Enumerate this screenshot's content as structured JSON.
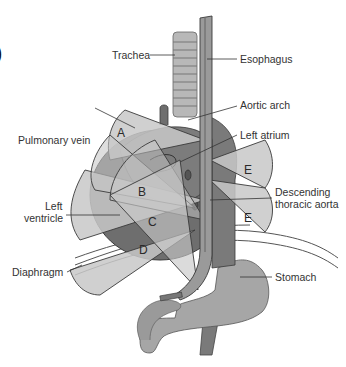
{
  "figure": {
    "partial_panel_mark": ")",
    "labels": {
      "trachea": "Trachea",
      "esophagus": "Esophagus",
      "aortic_arch": "Aortic arch",
      "pulmonary_vein": "Pulmonary vein",
      "left_atrium": "Left atrium",
      "left_ventricle_line1": "Left",
      "left_ventricle_line2": "ventricle",
      "descending_aorta_line1": "Descending",
      "descending_aorta_line2": "thoracic aorta",
      "diaphragm": "Diaphragm",
      "stomach": "Stomach"
    },
    "sectors": [
      "A",
      "B",
      "C",
      "D",
      "E",
      "E"
    ],
    "colors": {
      "background": "#ffffff",
      "light_gray": "#c8c8c8",
      "mid_gray": "#a9a9a9",
      "dark_gray": "#6e6e6e",
      "outline": "#3a3a3a",
      "text": "#333333"
    }
  }
}
